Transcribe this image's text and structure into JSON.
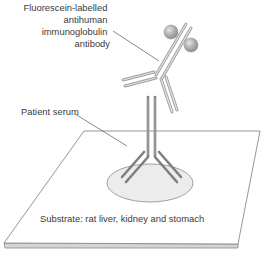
{
  "diagram": {
    "type": "indirect immunofluorescence schematic",
    "labels": {
      "fluorescein_antibody": [
        "Fluorescein-labelled",
        "antihuman",
        "immunoglobulin",
        "antibody"
      ],
      "patient_serum": "Patient serum",
      "substrate": "Substrate: rat liver, kidney and stomach"
    },
    "colors": {
      "outline": "#8a8a8a",
      "secondary_antibody": "#bdbdbd",
      "primary_antibody": "#8c8c8c",
      "serum_spot": "#ececec",
      "sphere": "#a8a8a8",
      "text": "#3a3a3a"
    }
  }
}
